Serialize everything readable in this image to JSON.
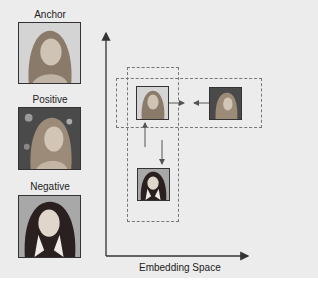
{
  "legend": {
    "anchor_label": "Anchor",
    "positive_label": "Positive",
    "negative_label": "Negative"
  },
  "plot": {
    "x_axis_label": "Embedding Space",
    "points": [
      {
        "role": "anchor",
        "position": "top-left"
      },
      {
        "role": "positive",
        "position": "top-right"
      },
      {
        "role": "negative",
        "position": "bottom"
      }
    ],
    "arrows": [
      {
        "from": "anchor",
        "to": "positive",
        "meaning": "pull together"
      },
      {
        "from": "positive",
        "to": "anchor",
        "meaning": "pull together"
      },
      {
        "from": "anchor",
        "to": "negative",
        "meaning": "push apart"
      },
      {
        "from": "negative",
        "to": "anchor",
        "meaning": "push apart"
      }
    ]
  },
  "colors": {
    "background": "#ececec",
    "axis": "#333333",
    "dash": "#777777"
  }
}
